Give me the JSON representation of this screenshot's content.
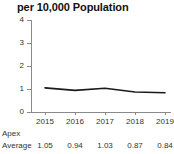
{
  "chart_data": {
    "type": "line",
    "title": "per 10,000 Population",
    "xlabel": "",
    "ylabel": "",
    "categories": [
      "2015",
      "2016",
      "2017",
      "2018",
      "2019"
    ],
    "x": [
      2015,
      2016,
      2017,
      2018,
      2019
    ],
    "series": [
      {
        "name": "Apex Average",
        "values": [
          1.05,
          0.94,
          1.03,
          0.87,
          0.84
        ],
        "color": "#1a1a1a"
      }
    ],
    "ylim": [
      0,
      4
    ],
    "yticks": [
      "0",
      "1",
      "2",
      "3",
      "4"
    ],
    "xlim": [
      2015,
      2019
    ],
    "grid": false,
    "legend": "none",
    "line_color": "#1a1a1a",
    "axis_color": "#8a8a8a"
  },
  "table": {
    "rows": [
      {
        "label": "Apex",
        "values": [
          "",
          "",
          "",
          "",
          ""
        ]
      },
      {
        "label": "Average",
        "values": [
          "1.05",
          "0.94",
          "1.03",
          "0.87",
          "0.84"
        ]
      }
    ]
  }
}
